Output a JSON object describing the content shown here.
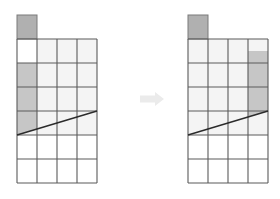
{
  "figure": {
    "title": "",
    "caption": "",
    "colors": {
      "grid_line": "#5a5a5a",
      "cell_fill": "#f4f4f4",
      "empty_fill": "#ffffff",
      "shaded_fill": "#c6c6c6",
      "block_fill": "#b0b0b0",
      "block_stroke": "#7a7a7a",
      "diagonal_line": "#2b2b2b",
      "arrow_fill": "#ebebeb",
      "background": "#ffffff"
    },
    "geometry": {
      "cell_width": 20,
      "cell_height": 24,
      "columns": 4,
      "rows": 6
    },
    "panels": [
      {
        "name": "before",
        "label": "",
        "origin_x": 17,
        "origin_y": 39,
        "top_block": {
          "label": "",
          "column": 0,
          "height": 24,
          "fill": "#b0b0b0"
        },
        "shaded_cells": [
          {
            "col": 0,
            "row": 1
          },
          {
            "col": 0,
            "row": 2
          },
          {
            "col": 0,
            "row": 3
          }
        ],
        "light_cells": [
          {
            "col": 1,
            "row": 0
          },
          {
            "col": 2,
            "row": 0
          },
          {
            "col": 3,
            "row": 0
          },
          {
            "col": 1,
            "row": 1
          },
          {
            "col": 2,
            "row": 1
          },
          {
            "col": 3,
            "row": 1
          },
          {
            "col": 1,
            "row": 2
          },
          {
            "col": 2,
            "row": 2
          },
          {
            "col": 3,
            "row": 2
          },
          {
            "col": 1,
            "row": 3
          },
          {
            "col": 2,
            "row": 3
          },
          {
            "col": 3,
            "row": 3
          }
        ],
        "diagonal": {
          "x1": 17,
          "y1": 135,
          "x2": 97,
          "y2": 111
        }
      },
      {
        "name": "after",
        "label": "",
        "origin_x": 188,
        "origin_y": 39,
        "top_block": {
          "label": "",
          "column": 0,
          "height": 24,
          "fill": "#b0b0b0"
        },
        "shaded_cells": [
          {
            "col": 3,
            "row": 1
          },
          {
            "col": 3,
            "row": 2
          },
          {
            "col": 3,
            "row": 3
          }
        ],
        "partial_shaded": {
          "col": 3,
          "row": 0,
          "fill_from_fraction": 0.5
        },
        "light_cells": [
          {
            "col": 0,
            "row": 0
          },
          {
            "col": 1,
            "row": 0
          },
          {
            "col": 2,
            "row": 0
          },
          {
            "col": 0,
            "row": 1
          },
          {
            "col": 1,
            "row": 1
          },
          {
            "col": 2,
            "row": 1
          },
          {
            "col": 0,
            "row": 2
          },
          {
            "col": 1,
            "row": 2
          },
          {
            "col": 2,
            "row": 2
          },
          {
            "col": 0,
            "row": 3
          },
          {
            "col": 1,
            "row": 3
          },
          {
            "col": 2,
            "row": 3
          }
        ],
        "diagonal": {
          "x1": 188,
          "y1": 135,
          "x2": 268,
          "y2": 111
        }
      }
    ],
    "arrow": {
      "label": "",
      "direction": "right",
      "x": 140,
      "y": 99,
      "length": 24,
      "thickness": 7,
      "head_size": 9,
      "fill": "#ebebeb"
    }
  }
}
